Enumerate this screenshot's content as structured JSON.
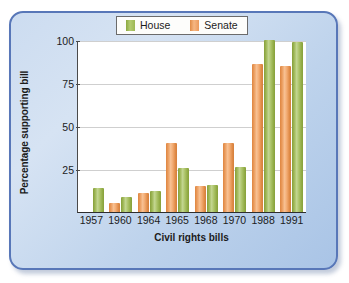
{
  "chart_data": {
    "type": "bar",
    "title": "",
    "xlabel": "Civil rights bills",
    "ylabel": "Percentage supporting bill",
    "categories": [
      "1957",
      "1960",
      "1964",
      "1965",
      "1968",
      "1970",
      "1988",
      "1991"
    ],
    "series": [
      {
        "name": "Senate",
        "color": "#eda268",
        "values": [
          null,
          5,
          11,
          40,
          15,
          40,
          86,
          85
        ]
      },
      {
        "name": "House",
        "color": "#a8c062",
        "values": [
          14,
          9,
          12,
          25.5,
          15.5,
          26,
          100,
          99
        ]
      }
    ],
    "ylim": [
      0,
      100
    ],
    "yticks": [
      25,
      50,
      75,
      100
    ],
    "ytick_labels": [
      "25",
      "50",
      "75",
      "100"
    ],
    "grid": true,
    "legend": {
      "position": "top-center",
      "entries": [
        {
          "label": "House",
          "swatch": "house-color-swatch"
        },
        {
          "label": "Senate",
          "swatch": "senate-color-swatch"
        }
      ]
    }
  },
  "frame": {
    "border_color": "#5877b8",
    "background_color": "#c7daef"
  }
}
